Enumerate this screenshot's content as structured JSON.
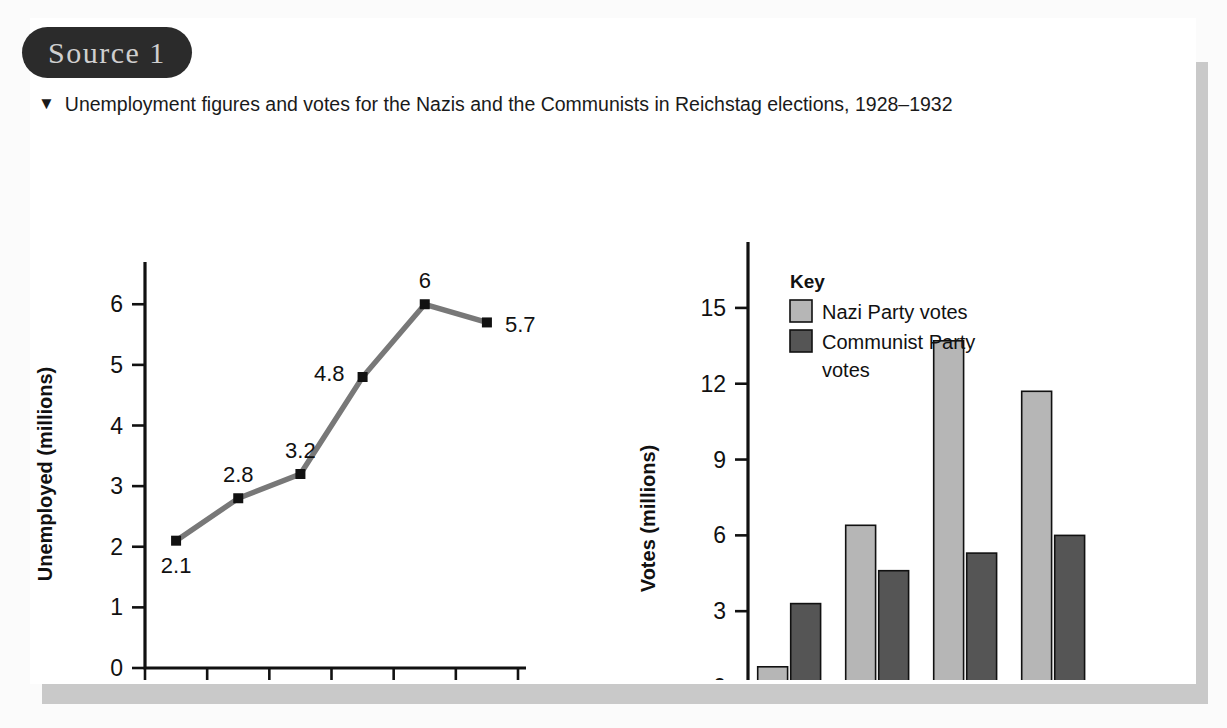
{
  "source_badge": {
    "label": "Source 1"
  },
  "caption": {
    "marker": "▼",
    "text": "Unemployment figures and votes for the Nazis and the Communists in Reichstag elections, 1928–1932"
  },
  "colors": {
    "nazi_bar": "#b6b6b6",
    "communist_bar": "#555555",
    "line": "#787878",
    "marker": "#111111",
    "axis": "#111111",
    "badge_bg": "#2b2b2b",
    "badge_text": "#cfcfcf",
    "card_bg": "#ffffff",
    "shadow": "#c9c9c9"
  },
  "chart_data": [
    {
      "type": "line",
      "title": "",
      "xlabel": "Date",
      "ylabel": "Unemployed (millions)",
      "ylim": [
        0,
        6.4
      ],
      "yticks": [
        "0",
        "1",
        "2",
        "3",
        "4",
        "5",
        "6"
      ],
      "ytick_values": [
        0,
        1,
        2,
        3,
        4,
        5,
        6
      ],
      "grid": false,
      "categories": [
        "1928\nJan",
        "1929\nJan",
        "1930\nJan",
        "1931\nJan",
        "1932\nJan",
        "1932\nDec"
      ],
      "category_lines": [
        [
          "1928",
          "Jan"
        ],
        [
          "1929",
          "Jan"
        ],
        [
          "1930",
          "Jan"
        ],
        [
          "1931",
          "Jan"
        ],
        [
          "1932",
          "Jan"
        ],
        [
          "1932",
          "Dec"
        ]
      ],
      "values": [
        2.1,
        2.8,
        3.2,
        4.8,
        6,
        5.7
      ],
      "point_labels": [
        "2.1",
        "2.8",
        "3.2",
        "4.8",
        "6",
        "5.7"
      ],
      "label_positions": [
        "below",
        "above",
        "above",
        "left",
        "above",
        "right"
      ]
    },
    {
      "type": "bar",
      "title": "",
      "xlabel": "Date",
      "ylabel": "Votes (millions)",
      "ylim": [
        0,
        16.5
      ],
      "yticks": [
        "0",
        "3",
        "6",
        "9",
        "12",
        "15"
      ],
      "ytick_values": [
        0,
        3,
        6,
        9,
        12,
        15
      ],
      "grid": false,
      "categories": [
        "1928",
        "1930",
        "1932\nJan",
        "1932\nNov"
      ],
      "category_lines": [
        [
          "1928",
          ""
        ],
        [
          "1930",
          ""
        ],
        [
          "1932",
          "Jan"
        ],
        [
          "1932",
          "Nov"
        ]
      ],
      "legend_title": "Key",
      "legend_position": "top-left-inside",
      "series": [
        {
          "name": "Nazi Party votes",
          "values": [
            0.8,
            6.4,
            13.7,
            11.7
          ]
        },
        {
          "name": "Communist Party votes",
          "values": [
            3.3,
            4.6,
            5.3,
            6.0
          ]
        }
      ]
    }
  ],
  "line_chart": {
    "ylabel": "Unemployed (millions)",
    "xlabel": "Date",
    "yticks": [
      "0",
      "1",
      "2",
      "3",
      "4",
      "5",
      "6"
    ],
    "xlabels_top": [
      "1928",
      "1929",
      "1930",
      "1931",
      "1932",
      "1932"
    ],
    "xlabels_bottom": [
      "Jan",
      "Jan",
      "Jan",
      "Jan",
      "Jan",
      "Dec"
    ],
    "point_labels": [
      "2.1",
      "2.8",
      "3.2",
      "4.8",
      "6",
      "5.7"
    ]
  },
  "bar_chart": {
    "ylabel": "Votes (millions)",
    "xlabel": "Date",
    "yticks": [
      "0",
      "3",
      "6",
      "9",
      "12",
      "15"
    ],
    "xlabels_top": [
      "1928",
      "1930",
      "1932",
      "1932"
    ],
    "xlabels_bottom": [
      "",
      "",
      "Jan",
      "Nov"
    ],
    "key": {
      "title": "Key",
      "items": [
        {
          "label": "Nazi Party votes"
        },
        {
          "label_line1": "Communist Party",
          "label_line2": "votes"
        }
      ]
    }
  }
}
